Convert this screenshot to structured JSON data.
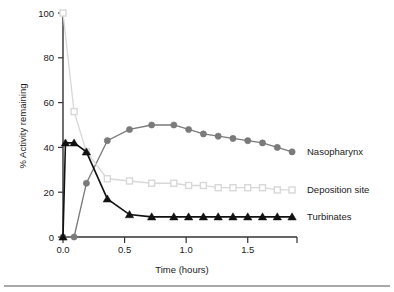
{
  "chart_data": {
    "type": "line",
    "title": "",
    "xlabel": "Time (hours)",
    "ylabel": "% Activity remaining",
    "xlim": [
      0.0,
      1.9
    ],
    "ylim": [
      0,
      100
    ],
    "xticks": [
      "0.0",
      "0.5",
      "1.0",
      "1.5"
    ],
    "xtick_values": [
      0.0,
      0.5,
      1.0,
      1.5
    ],
    "yticks": [
      "0",
      "20",
      "40",
      "60",
      "80",
      "100"
    ],
    "ytick_values": [
      0,
      20,
      40,
      60,
      80,
      100
    ],
    "grid": false,
    "legend_position": "right-inline",
    "series": [
      {
        "name": "Nasopharynx",
        "marker": "filled-circle",
        "color": "#7a7a7a",
        "x": [
          0.0,
          0.09,
          0.19,
          0.36,
          0.54,
          0.72,
          0.9,
          1.02,
          1.14,
          1.26,
          1.38,
          1.5,
          1.62,
          1.74,
          1.86
        ],
        "y": [
          0,
          0,
          24,
          43,
          48,
          50,
          50,
          48,
          46,
          45,
          44,
          43,
          42,
          40,
          38
        ]
      },
      {
        "name": "Deposition site",
        "marker": "open-square",
        "color": "#d8d8d8",
        "x": [
          0.0,
          0.09,
          0.19,
          0.36,
          0.54,
          0.72,
          0.9,
          1.02,
          1.14,
          1.26,
          1.38,
          1.5,
          1.62,
          1.74,
          1.86
        ],
        "y": [
          100,
          56,
          38,
          26,
          25,
          24,
          24,
          23,
          23,
          22,
          22,
          22,
          22,
          21,
          21
        ]
      },
      {
        "name": "Turbinates",
        "marker": "filled-triangle",
        "color": "#111111",
        "x": [
          0.0,
          0.02,
          0.09,
          0.19,
          0.36,
          0.54,
          0.72,
          0.9,
          1.02,
          1.14,
          1.26,
          1.38,
          1.5,
          1.62,
          1.74,
          1.86
        ],
        "y": [
          0,
          42,
          42,
          38,
          17,
          10,
          9,
          9,
          9,
          9,
          9,
          9,
          9,
          9,
          9,
          9
        ]
      }
    ],
    "series_labels": [
      {
        "text": "Nasopharynx",
        "at_y": 38
      },
      {
        "text": "Deposition site",
        "at_y": 21
      },
      {
        "text": "Turbinates",
        "at_y": 9
      }
    ]
  }
}
